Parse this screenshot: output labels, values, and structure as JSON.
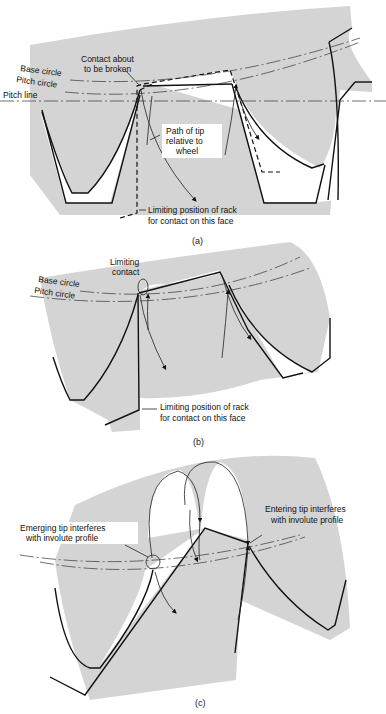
{
  "figure": {
    "panels": [
      {
        "id": "a",
        "caption": "(a)",
        "labels": {
          "base_circle": "Base circle",
          "pitch_circle": "Pitch circle",
          "pitch_line": "Pitch line",
          "contact_1": "Contact about",
          "contact_2": "to be broken",
          "path_1": "Path of tip",
          "path_2": "relative to",
          "path_3": "wheel",
          "limit_1": "Limiting position of rack",
          "limit_2": "for contact on this face"
        }
      },
      {
        "id": "b",
        "caption": "(b)",
        "labels": {
          "limiting_1": "Limiting",
          "limiting_2": "contact",
          "base_circle": "Base circle",
          "pitch_circle": "Pitch circle",
          "limit_1": "Limiting position of rack",
          "limit_2": "for contact on this face"
        }
      },
      {
        "id": "c",
        "caption": "(c)",
        "labels": {
          "emerging_1": "Emerging tip interferes",
          "emerging_2": "with involute profile",
          "entering_1": "Entering tip interferes",
          "entering_2": "with involute profile"
        }
      }
    ],
    "colors": {
      "wheel_fill": "#d4d4d4",
      "line": "#111111",
      "background": "#ffffff"
    }
  }
}
